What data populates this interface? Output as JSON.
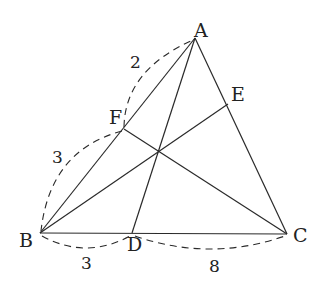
{
  "diagram": {
    "type": "triangle-cevians",
    "points": {
      "A": {
        "label": "A",
        "x": 195,
        "y": 38
      },
      "B": {
        "label": "B",
        "x": 40,
        "y": 233
      },
      "C": {
        "label": "C",
        "x": 287,
        "y": 234
      },
      "D": {
        "label": "D",
        "x": 132,
        "y": 233
      },
      "E": {
        "label": "E",
        "x": 228,
        "y": 104
      },
      "F": {
        "label": "F",
        "x": 124,
        "y": 129
      },
      "O": {
        "x": 158,
        "y": 150
      }
    },
    "segments": [
      "AB",
      "BC",
      "CA",
      "AD",
      "BE",
      "CF"
    ],
    "measurements": [
      {
        "between": "AF",
        "value": "2"
      },
      {
        "between": "FB",
        "value": "3"
      },
      {
        "between": "BD",
        "value": "3"
      },
      {
        "between": "DC",
        "value": "8"
      }
    ]
  }
}
